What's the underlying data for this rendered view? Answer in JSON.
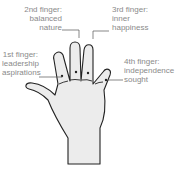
{
  "diagram": {
    "type": "palmistry finger meanings",
    "labels": [
      {
        "id": "finger-1",
        "lines": [
          "1st finger:",
          "leadership",
          "aspirations"
        ]
      },
      {
        "id": "finger-2",
        "lines": [
          "2nd finger:",
          "balanced",
          "nature"
        ]
      },
      {
        "id": "finger-3",
        "lines": [
          "3rd finger:",
          "inner",
          "happiness"
        ]
      },
      {
        "id": "finger-4",
        "lines": [
          "4th finger:",
          "independence",
          "sought"
        ]
      }
    ],
    "colors": {
      "hand_fill": "#ececec",
      "outline": "#222222",
      "leader_line": "#555555",
      "text": "#8a8a8a"
    }
  }
}
